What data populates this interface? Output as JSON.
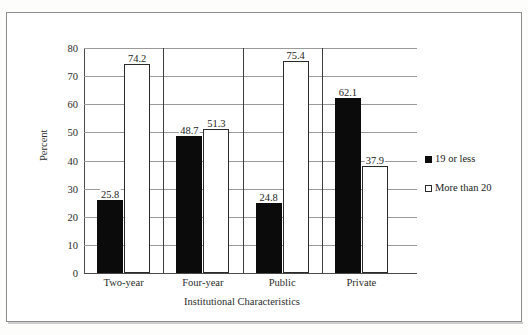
{
  "chart_data": {
    "type": "bar",
    "title": "",
    "xlabel": "Institutional Characteristics",
    "ylabel": "Percent",
    "ylim": [
      0,
      80
    ],
    "ytick_step": 10,
    "yticks": [
      "80",
      "70",
      "60",
      "50",
      "40",
      "30",
      "20",
      "10",
      "0"
    ],
    "grid": true,
    "legend_position": "right",
    "categories": [
      "Two-year",
      "Four-year",
      "Public",
      "Private"
    ],
    "series": [
      {
        "name": "19 or less",
        "color": "#0b0b0b",
        "fill": "solid",
        "values": [
          25.8,
          48.7,
          24.8,
          62.1
        ],
        "labels": [
          "25.8",
          "48.7",
          "24.8",
          "62.1"
        ]
      },
      {
        "name": "More than 20",
        "color": "#ffffff",
        "fill": "hollow",
        "values": [
          74.2,
          51.3,
          75.4,
          37.9
        ],
        "labels": [
          "74.2",
          "51.3",
          "75.4",
          "37.9"
        ]
      }
    ]
  },
  "legend": {
    "items": [
      {
        "label": "19 or less",
        "swatch": "filled-square-icon"
      },
      {
        "label": "More than 20",
        "swatch": "hollow-square-icon"
      }
    ]
  },
  "axes": {
    "y_title": "Percent",
    "x_title": "Institutional Characteristics"
  }
}
